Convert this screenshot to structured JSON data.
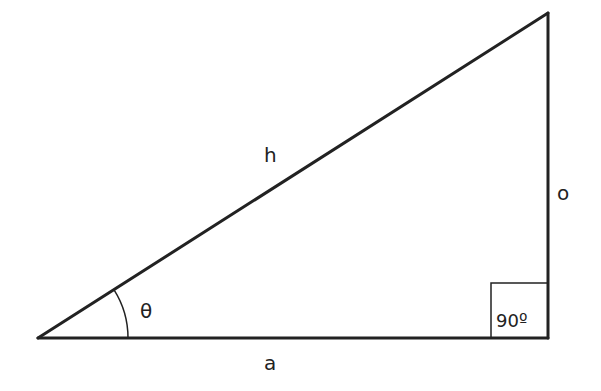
{
  "diagram": {
    "colors": {
      "stroke": "#222222",
      "background": "#ffffff"
    },
    "vertices": {
      "angle_vertex": [
        38,
        338
      ],
      "right_angle_vertex": [
        548,
        338
      ],
      "top_vertex": [
        548,
        13
      ]
    },
    "labels": {
      "hypotenuse": "h",
      "opposite": "o",
      "adjacent": "a",
      "angle": "θ",
      "right_angle": "90º"
    }
  }
}
